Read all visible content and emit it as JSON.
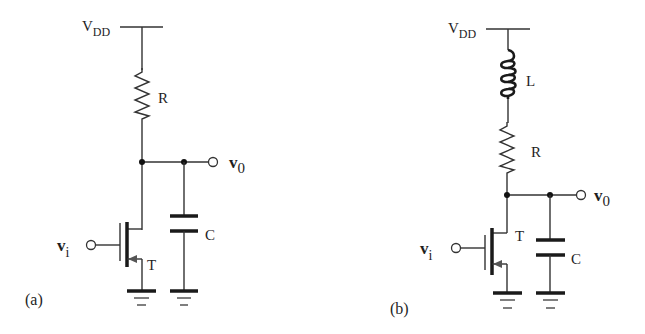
{
  "figure": {
    "panels": [
      {
        "id": "a",
        "caption": "(a)",
        "supply_label": "V",
        "supply_sub": "DD",
        "components": {
          "resistor": "R",
          "capacitor": "C",
          "transistor": "T"
        },
        "input_label": "v",
        "input_sub": "i",
        "output_label": "v",
        "output_sub": "0"
      },
      {
        "id": "b",
        "caption": "(b)",
        "supply_label": "V",
        "supply_sub": "DD",
        "components": {
          "inductor": "L",
          "resistor": "R",
          "capacitor": "C",
          "transistor": "T"
        },
        "input_label": "v",
        "input_sub": "i",
        "output_label": "v",
        "output_sub": "0"
      }
    ]
  }
}
